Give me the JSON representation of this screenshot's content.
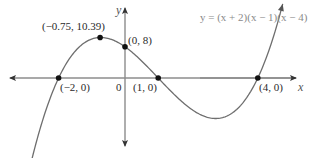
{
  "chart_data": {
    "type": "line",
    "title": "",
    "equation": "y = (x + 2)(x − 1)(x − 4)",
    "function": {
      "roots": [
        -2,
        1,
        4
      ],
      "leading_coefficient": 1
    },
    "xlabel": "x",
    "ylabel": "y",
    "xlim": [
      -3.5,
      5.5
    ],
    "ylim": [
      -20,
      18
    ],
    "grid": false,
    "legend": null,
    "origin_label": "0",
    "points": [
      {
        "x": -2,
        "y": 0,
        "label": "(−2, 0)"
      },
      {
        "x": -0.75,
        "y": 10.39,
        "label": "(−0.75, 10.39)"
      },
      {
        "x": 0,
        "y": 8,
        "label": "(0, 8)"
      },
      {
        "x": 1,
        "y": 0,
        "label": "(1, 0)"
      },
      {
        "x": 4,
        "y": 0,
        "label": "(4, 0)"
      }
    ],
    "annotations": [
      "local maximum (−0.75, 10.39)",
      "y-intercept (0, 8)",
      "x-intercepts (−2, 0), (1, 0), (4, 0)"
    ]
  },
  "labels": {
    "equation": "y = (x + 2)(x − 1)(x − 4)",
    "x_axis": "x",
    "y_axis": "y",
    "origin": "0",
    "p_max": "(−0.75, 10.39)",
    "p_yint": "(0, 8)",
    "p_root1": "(−2, 0)",
    "p_root2": "(1, 0)",
    "p_root3": "(4, 0)"
  },
  "colors": {
    "axis": "#8c8c8c",
    "curve": "#6e6e6e",
    "point": "#111111",
    "text": "#2a2a2a"
  }
}
